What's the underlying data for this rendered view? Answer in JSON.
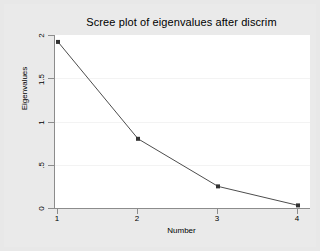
{
  "chart_data": {
    "type": "line",
    "title": "Scree plot of eigenvalues after discrim",
    "xlabel": "Number",
    "ylabel": "Eigenvalues",
    "x": [
      1,
      2,
      3,
      4
    ],
    "values": [
      1.92,
      0.8,
      0.25,
      0.03
    ],
    "series": [
      {
        "name": "Eigenvalues",
        "values": [
          1.92,
          0.8,
          0.25,
          0.03
        ]
      }
    ],
    "xtick_labels": [
      "1",
      "2",
      "3",
      "4"
    ],
    "ytick_labels": [
      "0",
      ".5",
      "1",
      "1.5",
      "2"
    ],
    "ytick_values": [
      0,
      0.5,
      1,
      1.5,
      2
    ],
    "xlim": [
      1,
      4
    ],
    "ylim": [
      0,
      2
    ],
    "grid": "horizontal-faint",
    "legend": "none",
    "marker": "filled-square",
    "line_color": "#4d4d4d",
    "marker_color": "#333333",
    "plot_background": "#ffffff",
    "graph_background": "#eaeaea"
  }
}
